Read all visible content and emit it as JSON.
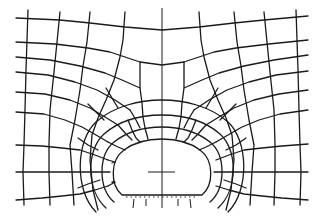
{
  "diagram": {
    "type": "finite-element-mesh",
    "stroke_color": "#1a1a1a",
    "background_color": "#ffffff",
    "opening": {
      "shape": "horseshoe",
      "center": [
        162,
        172
      ],
      "width": 98,
      "top_y": 140,
      "floor_y": 195
    },
    "symmetry_axis_x": 162,
    "horizontal_marker": {
      "y": 172,
      "x1": 148,
      "x2": 175
    }
  }
}
